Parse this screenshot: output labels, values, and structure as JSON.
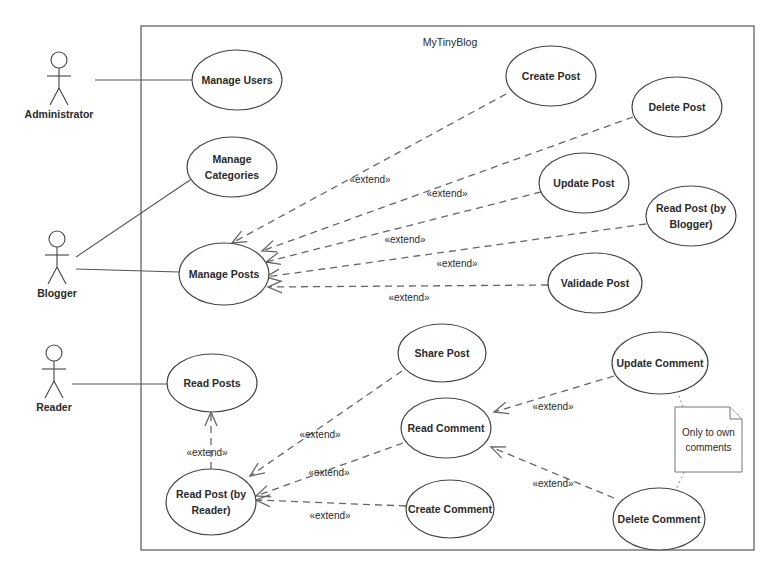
{
  "diagram": {
    "type": "use-case",
    "colors": {
      "stroke": "#444444",
      "text": "#2a2a2a",
      "background": "#ffffff"
    },
    "system": {
      "title": "MyTinyBlog",
      "x": 141,
      "y": 26,
      "width": 613,
      "height": 524,
      "title_x": 450,
      "title_y": 46
    },
    "actors": [
      {
        "id": "administrator",
        "label": "Administrator",
        "x": 59,
        "head_y": 60
      },
      {
        "id": "blogger",
        "label": "Blogger",
        "x": 57,
        "head_y": 239
      },
      {
        "id": "reader",
        "label": "Reader",
        "x": 54,
        "head_y": 353
      }
    ],
    "use_cases": [
      {
        "id": "manage-users",
        "lines": [
          "Manage Users"
        ],
        "cx": 237,
        "cy": 80,
        "rx": 45,
        "ry": 30
      },
      {
        "id": "manage-categories",
        "lines": [
          "Manage",
          "Categories"
        ],
        "cx": 232,
        "cy": 167,
        "rx": 45,
        "ry": 30
      },
      {
        "id": "manage-posts",
        "lines": [
          "Manage Posts"
        ],
        "cx": 224,
        "cy": 274,
        "rx": 45,
        "ry": 31
      },
      {
        "id": "create-post",
        "lines": [
          "Create Post"
        ],
        "cx": 551,
        "cy": 76,
        "rx": 45,
        "ry": 30
      },
      {
        "id": "delete-post",
        "lines": [
          "Delete Post"
        ],
        "cx": 677,
        "cy": 107,
        "rx": 45,
        "ry": 30
      },
      {
        "id": "update-post",
        "lines": [
          "Update Post"
        ],
        "cx": 584,
        "cy": 183,
        "rx": 45,
        "ry": 30
      },
      {
        "id": "read-post-blogger",
        "lines": [
          "Read Post (by",
          "Blogger)"
        ],
        "cx": 691,
        "cy": 216,
        "rx": 45,
        "ry": 30
      },
      {
        "id": "validade-post",
        "lines": [
          "Validade Post"
        ],
        "cx": 595,
        "cy": 283,
        "rx": 47,
        "ry": 30
      },
      {
        "id": "read-posts",
        "lines": [
          "Read Posts"
        ],
        "cx": 212,
        "cy": 383,
        "rx": 45,
        "ry": 29
      },
      {
        "id": "read-post-reader",
        "lines": [
          "Read Post (by",
          "Reader)"
        ],
        "cx": 211,
        "cy": 502,
        "rx": 45,
        "ry": 33
      },
      {
        "id": "share-post",
        "lines": [
          "Share Post"
        ],
        "cx": 442,
        "cy": 353,
        "rx": 44,
        "ry": 29
      },
      {
        "id": "read-comment",
        "lines": [
          "Read Comment"
        ],
        "cx": 446,
        "cy": 428,
        "rx": 45,
        "ry": 30
      },
      {
        "id": "create-comment",
        "lines": [
          "Create Comment"
        ],
        "cx": 450,
        "cy": 509,
        "rx": 44,
        "ry": 29
      },
      {
        "id": "update-comment",
        "lines": [
          "Update Comment"
        ],
        "cx": 660,
        "cy": 363,
        "rx": 48,
        "ry": 31
      },
      {
        "id": "delete-comment",
        "lines": [
          "Delete Comment"
        ],
        "cx": 659,
        "cy": 519,
        "rx": 46,
        "ry": 31
      }
    ],
    "associations": [
      {
        "from": [
          95,
          80
        ],
        "to": [
          192,
          80
        ]
      },
      {
        "from": [
          76,
          257
        ],
        "to": [
          190,
          180
        ]
      },
      {
        "from": [
          76,
          269
        ],
        "to": [
          179,
          272
        ]
      },
      {
        "from": [
          72,
          384
        ],
        "to": [
          167,
          384
        ]
      }
    ],
    "extends": [
      {
        "from": [
          506,
          94
        ],
        "to": [
          232,
          243
        ],
        "label": "«extend»",
        "lx": 370,
        "ly": 183
      },
      {
        "from": [
          633,
          117
        ],
        "to": [
          262,
          251
        ],
        "label": "«extend»",
        "lx": 447,
        "ly": 197
      },
      {
        "from": [
          541,
          192
        ],
        "to": [
          266,
          262
        ],
        "label": "«extend»",
        "lx": 405,
        "ly": 243
      },
      {
        "from": [
          646,
          224
        ],
        "to": [
          266,
          277
        ],
        "label": "«extend»",
        "lx": 457,
        "ly": 267
      },
      {
        "from": [
          548,
          285
        ],
        "to": [
          268,
          287
        ],
        "label": "«extend»",
        "lx": 409,
        "ly": 301
      },
      {
        "from": [
          211,
          469
        ],
        "to": [
          211,
          412
        ],
        "label": "«extend»",
        "lx": 207,
        "ly": 456
      },
      {
        "from": [
          402,
          371
        ],
        "to": [
          250,
          476
        ],
        "label": "«extend»",
        "lx": 320,
        "ly": 438
      },
      {
        "from": [
          403,
          443
        ],
        "to": [
          256,
          496
        ],
        "label": "«extend»",
        "lx": 329,
        "ly": 476
      },
      {
        "from": [
          406,
          506
        ],
        "to": [
          256,
          500
        ],
        "label": "«extend»",
        "lx": 330,
        "ly": 519
      },
      {
        "from": [
          614,
          376
        ],
        "to": [
          494,
          412
        ],
        "label": "«extend»",
        "lx": 553,
        "ly": 410
      },
      {
        "from": [
          614,
          498
        ],
        "to": [
          491,
          447
        ],
        "label": "«extend»",
        "lx": 553,
        "ly": 487
      }
    ],
    "note": {
      "lines": [
        "Only to own",
        "comments"
      ],
      "x": 675,
      "y": 407,
      "width": 67,
      "height": 65,
      "fold": 12,
      "links": [
        {
          "from": [
            683,
            407
          ],
          "to": [
            678,
            393
          ]
        },
        {
          "from": [
            684,
            472
          ],
          "to": [
            676,
            490
          ]
        }
      ]
    }
  }
}
